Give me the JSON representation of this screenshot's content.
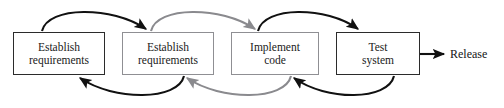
{
  "diagram": {
    "type": "process-flow",
    "nodes": [
      {
        "id": "establish-requirements-1",
        "label": "Establish\nrequirements",
        "line1": "Establish",
        "line2": "requirements",
        "x": 13,
        "y": 32,
        "w": 92,
        "h": 43,
        "border": "dark",
        "border_color": "#2b2b2b"
      },
      {
        "id": "establish-requirements-2",
        "label": "Establish\nrequirements",
        "line1": "Establish",
        "line2": "requirements",
        "x": 122,
        "y": 32,
        "w": 92,
        "h": 43,
        "border": "light",
        "border_color": "#8f8f93"
      },
      {
        "id": "implement-code",
        "label": "Implement\ncode",
        "line1": "Implement",
        "line2": "code",
        "x": 231,
        "y": 32,
        "w": 88,
        "h": 43,
        "border": "light",
        "border_color": "#8f8f93"
      },
      {
        "id": "test-system",
        "label": "Test\nsystem",
        "line1": "Test",
        "line2": "system",
        "x": 336,
        "y": 32,
        "w": 84,
        "h": 43,
        "border": "dark",
        "border_color": "#2b2b2b"
      }
    ],
    "arcs": [
      {
        "id": "arc-forward-1",
        "from": "establish-requirements-1",
        "to": "establish-requirements-2",
        "direction": "forward",
        "position": "above",
        "color": "#111111"
      },
      {
        "id": "arc-back-1",
        "from": "establish-requirements-2",
        "to": "establish-requirements-1",
        "direction": "backward",
        "position": "below",
        "color": "#111111"
      },
      {
        "id": "arc-forward-2",
        "from": "establish-requirements-2",
        "to": "implement-code",
        "direction": "forward",
        "position": "above",
        "color": "#8a8a8e"
      },
      {
        "id": "arc-back-2",
        "from": "implement-code",
        "to": "establish-requirements-2",
        "direction": "backward",
        "position": "below",
        "color": "#8a8a8e"
      },
      {
        "id": "arc-forward-3",
        "from": "implement-code",
        "to": "test-system",
        "direction": "forward",
        "position": "above",
        "color": "#111111"
      },
      {
        "id": "arc-back-3",
        "from": "test-system",
        "to": "implement-code",
        "direction": "backward",
        "position": "below",
        "color": "#111111"
      }
    ],
    "exit": {
      "id": "release-arrow",
      "from": "test-system",
      "label": "Release",
      "arrow_start_x": 420,
      "arrow_end_x": 447,
      "arrow_y": 54,
      "label_x": 450,
      "color": "#111111"
    }
  }
}
